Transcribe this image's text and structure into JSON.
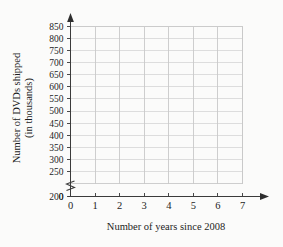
{
  "chart_data": {
    "type": "scatter",
    "title": "",
    "subtitle": "",
    "xlabel": "Number of years since 2008",
    "ylabel": "Number of DVDs shipped (in thousands)",
    "ylabel_line1": "Number of DVDs shipped",
    "ylabel_line2": "(in thousands)",
    "x": [],
    "values": [],
    "series": [],
    "annotations": [],
    "legend": [],
    "legend_position": "none",
    "grid": true,
    "xlim": [
      0,
      7
    ],
    "ylim": [
      200,
      850
    ],
    "y_axis_break": true,
    "y_axis_break_between": [
      0,
      200
    ],
    "x_ticks": [
      0,
      1,
      2,
      3,
      4,
      5,
      6,
      7
    ],
    "x_tick_labels": [
      "0",
      "1",
      "2",
      "3",
      "4",
      "5",
      "6",
      "7"
    ],
    "y_ticks": [
      0,
      200,
      250,
      300,
      350,
      400,
      450,
      500,
      550,
      600,
      650,
      700,
      750,
      800,
      850
    ],
    "y_tick_labels": [
      "0",
      "200",
      "250",
      "300",
      "350",
      "400",
      "450",
      "500",
      "550",
      "600",
      "650",
      "700",
      "750",
      "800",
      "850"
    ],
    "y_grid_values": [
      200,
      250,
      300,
      350,
      400,
      450,
      500,
      550,
      600,
      650,
      700,
      750,
      800,
      850
    ],
    "colors": {
      "background": "#fbfbfa",
      "axis": "#3b3b3b",
      "grid_horizontal": "#d6d6d6",
      "grid_vertical": "#c9c9c9",
      "text": "#1d1d1d"
    }
  }
}
